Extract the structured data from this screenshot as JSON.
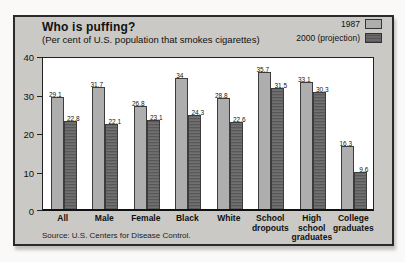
{
  "chart_data": {
    "type": "bar",
    "title": "Who is puffing?",
    "subtitle": "(Per cent of U.S. population that smokes cigarettes)",
    "categories": [
      "All",
      "Male",
      "Female",
      "Black",
      "White",
      "School\ndropouts",
      "High\nschool\ngraduates",
      "College\ngraduates"
    ],
    "series": [
      {
        "name": "1987",
        "color": "#aeaeae",
        "values": [
          29.1,
          31.7,
          26.8,
          34,
          28.8,
          35.7,
          33.1,
          16.3
        ]
      },
      {
        "name": "2000 (projection)",
        "color": "#696969",
        "values": [
          22.8,
          22.1,
          23.1,
          24.3,
          22.6,
          31.5,
          30.3,
          9.6
        ]
      }
    ],
    "ylim": [
      0,
      40
    ],
    "yticks": [
      0,
      10,
      20,
      30,
      40
    ],
    "grid": false,
    "legend_position": "top-right",
    "value_labels": true
  },
  "source": "Source: U.S. Centers for Disease Control.",
  "colors": {
    "panel_background": "#cac9c5",
    "plot_background": "#ffffff",
    "bar_1987": "#aeaeae",
    "bar_2000": "#696969",
    "border": "#2a2a2a"
  }
}
